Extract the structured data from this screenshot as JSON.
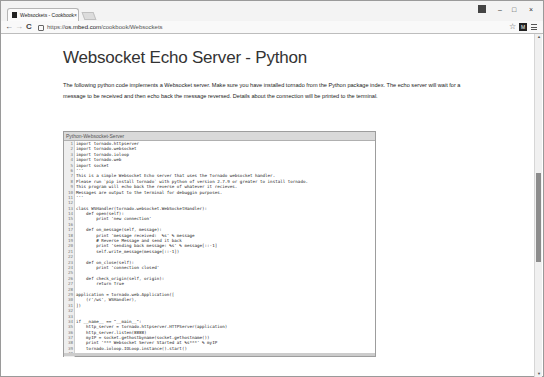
{
  "browser": {
    "tab": {
      "title": "Websockets - Cookbook",
      "close": "×"
    },
    "window_controls": {
      "user": "&",
      "minimize": "–",
      "maximize": "□",
      "close": "×"
    },
    "nav": {
      "back": "←",
      "forward": "→",
      "reload": "C"
    },
    "url": {
      "scheme": "https://",
      "host": "os.mbed.com",
      "path": "/cookbook/Websockets"
    },
    "extension_label": "M",
    "scroll": {
      "position_fraction": 0.55,
      "thumb_fraction": 0.27
    }
  },
  "page": {
    "title": "Websocket Echo Server - Python",
    "intro": "The following python code implements a Websocket server. Make sure you have installed tornado from the Python package index. The echo server will wait for a message to be received and then echo back the message reversed. Details about the connection will be printed to the terminal.",
    "code": {
      "header": "Python-Websocket-Server",
      "lines": [
        "import tornado.httpserver",
        "import tornado.websocket",
        "import tornado.ioloop",
        "import tornado.web",
        "import socket",
        "'''",
        "This is a simple Websocket Echo server that uses the Tornado websocket handler.",
        "Please run `pip install tornado` with python of version 2.7.9 or greater to install tornado.",
        "This program will echo back the reverse of whatever it recieves.",
        "Messages are output to the terminal for debuggin purposes.",
        "'''",
        "",
        "class WSHandler(tornado.websocket.WebSocketHandler):",
        "    def open(self):",
        "        print 'new connection'",
        "",
        "    def on_message(self, message):",
        "        print 'message received:  %s' % message",
        "        # Reverse Message and send it back",
        "        print 'sending back message: %s' % message[::-1]",
        "        self.write_message(message[::-1])",
        "",
        "    def on_close(self):",
        "        print 'connection closed'",
        "",
        "    def check_origin(self, origin):",
        "        return True",
        "",
        "application = tornado.web.Application([",
        "    (r'/ws', WSHandler),",
        "])",
        "",
        "",
        "if __name__ == \"__main__\":",
        "    http_server = tornado.httpserver.HTTPServer(application)",
        "    http_server.listen(8888)",
        "    myIP = socket.gethostbyname(socket.gethostname())",
        "    print '*** Websocket Server Started at %s***' % myIP",
        "    tornado.ioloop.IOLoop.instance().start()",
        ""
      ]
    }
  }
}
